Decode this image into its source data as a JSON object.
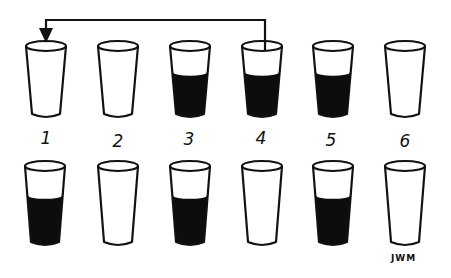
{
  "diagram": {
    "ink_color": "#111111",
    "liquid_color": "#0d0d0d",
    "background": "#ffffff",
    "top_row": {
      "glasses": [
        {
          "label": "1",
          "filled": false
        },
        {
          "label": "2",
          "filled": false
        },
        {
          "label": "3",
          "filled": true
        },
        {
          "label": "4",
          "filled": true
        },
        {
          "label": "5",
          "filled": true
        },
        {
          "label": "6",
          "filled": false
        }
      ]
    },
    "pour_arrow": {
      "from": "4",
      "to": "1"
    },
    "bottom_row": {
      "glasses": [
        {
          "filled": true
        },
        {
          "filled": false
        },
        {
          "filled": true
        },
        {
          "filled": false
        },
        {
          "filled": true
        },
        {
          "filled": false
        }
      ]
    },
    "signature": "JWM"
  }
}
